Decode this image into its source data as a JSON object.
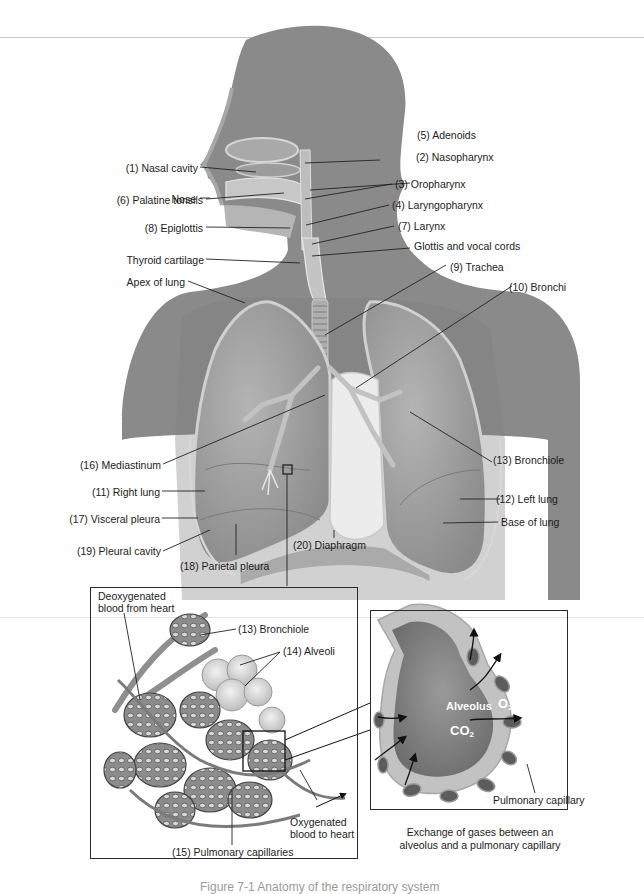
{
  "figure": {
    "caption_clipped": "Figure 7-1  Anatomy of the respiratory system",
    "domain_description": "Labeled anatomical diagram of the human respiratory system with alveoli and gas-exchange insets"
  },
  "colors": {
    "silhouette": "#808080",
    "lung_fill": "#9a9a9a",
    "lung_edge": "#c9c9c9",
    "heart_space": "#ececec",
    "leader_line": "#222222",
    "alveolus_inner": "#8d8d8d",
    "alveolus_wall": "#c6c6c6",
    "text": "#1c1c1c"
  },
  "main_diagram": {
    "labels_left": [
      {
        "id": "nasal-cavity",
        "text": "(1) Nasal cavity"
      },
      {
        "id": "nose",
        "text": "Nose"
      },
      {
        "id": "palatine-tonsils",
        "text": "(6) Palatine tonsils"
      },
      {
        "id": "epiglottis",
        "text": "(8) Epiglottis"
      },
      {
        "id": "thyroid-cartilage",
        "text": "Thyroid cartilage"
      },
      {
        "id": "apex-of-lung",
        "text": "Apex of lung"
      },
      {
        "id": "mediastinum",
        "text": "(16) Mediastinum"
      },
      {
        "id": "right-lung",
        "text": "(11) Right lung"
      },
      {
        "id": "visceral-pleura",
        "text": "(17) Visceral pleura"
      },
      {
        "id": "pleural-cavity",
        "text": "(19) Pleural cavity"
      },
      {
        "id": "parietal-pleura",
        "text": "(18) Parietal pleura"
      }
    ],
    "labels_right": [
      {
        "id": "adenoids",
        "text": "(5) Adenoids"
      },
      {
        "id": "nasopharynx",
        "text": "(2) Nasopharynx"
      },
      {
        "id": "oropharynx",
        "text": "(3) Oropharynx"
      },
      {
        "id": "laryngopharynx",
        "text": "(4) Laryngopharynx"
      },
      {
        "id": "larynx",
        "text": "(7) Larynx"
      },
      {
        "id": "glottis",
        "text": "Glottis and vocal cords"
      },
      {
        "id": "trachea",
        "text": "(9) Trachea"
      },
      {
        "id": "bronchi",
        "text": "(10) Bronchi"
      },
      {
        "id": "bronchiole",
        "text": "(13) Bronchiole"
      },
      {
        "id": "left-lung",
        "text": "(12) Left lung"
      },
      {
        "id": "base-of-lung",
        "text": "Base of lung"
      },
      {
        "id": "diaphragm",
        "text": "(20) Diaphragm"
      }
    ]
  },
  "alveoli_inset": {
    "labels": {
      "deoxygenated": "Deoxygenated\nblood from heart",
      "deoxygenated_line1": "Deoxygenated",
      "deoxygenated_line2": "blood from heart",
      "bronchiole": "(13) Bronchiole",
      "alveoli": "(14) Alveoli",
      "oxygenated_line1": "Oxygenated",
      "oxygenated_line2": "blood to heart",
      "pulmonary_capillaries": "(15) Pulmonary capillaries"
    }
  },
  "gas_exchange_inset": {
    "labels": {
      "alveolus": "Alveolus",
      "o2": "O",
      "o2_sub": "2",
      "co2": "CO",
      "co2_sub": "2",
      "pulmonary_capillary": "Pulmonary capillary"
    },
    "caption_line1": "Exchange of gases between an",
    "caption_line2": "alveolus and a pulmonary capillary"
  }
}
